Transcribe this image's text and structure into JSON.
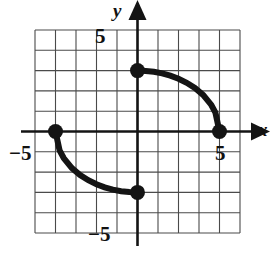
{
  "figure": {
    "kind": "coordinate-grid-graph",
    "background": "#ffffff",
    "ink_color": "#141414",
    "grid_color": "#4a4a4a"
  },
  "axes": {
    "x_axis_label": "x",
    "y_axis_label": "y",
    "x_range": [
      -5,
      5
    ],
    "y_range": [
      -5,
      5
    ],
    "grid": true,
    "grid_step": 1,
    "tick_labels": {
      "y_top": "5",
      "y_bottom": "−5",
      "x_right": "5",
      "x_left": "−5"
    },
    "arrows": {
      "x_positive": true,
      "y_positive": true
    }
  },
  "chart_data": {
    "type": "line",
    "title": "",
    "xlabel": "x",
    "ylabel": "y",
    "xlim": [
      -5,
      5
    ],
    "ylim": [
      -5,
      5
    ],
    "grid": true,
    "legend": "none",
    "series": [
      {
        "name": "arc-quadrant-I",
        "comment": "ellipse arc x^2/16 + y^2/9 = 1, from (0,3) to (4,0)",
        "x": [
          0.0,
          0.4,
          0.8,
          1.2,
          1.6,
          2.0,
          2.4,
          2.8,
          3.2,
          3.6,
          3.8,
          4.0
        ],
        "y": [
          3.0,
          2.985,
          2.94,
          2.863,
          2.751,
          2.598,
          2.4,
          2.142,
          1.8,
          1.308,
          0.936,
          0.0
        ]
      },
      {
        "name": "arc-quadrant-III",
        "comment": "ellipse arc x^2/16 + y^2/9 = 1, from (-4,0) to (0,-3)",
        "x": [
          -4.0,
          -3.8,
          -3.6,
          -3.2,
          -2.8,
          -2.4,
          -2.0,
          -1.6,
          -1.2,
          -0.8,
          -0.4,
          0.0
        ],
        "y": [
          0.0,
          -0.936,
          -1.308,
          -1.8,
          -2.142,
          -2.4,
          -2.598,
          -2.751,
          -2.863,
          -2.94,
          -2.985,
          -3.0
        ]
      }
    ],
    "points": [
      {
        "name": "left-endpoint",
        "x": -4,
        "y": 0,
        "marker": "filled-circle"
      },
      {
        "name": "top-endpoint",
        "x": 0,
        "y": 3,
        "marker": "filled-circle"
      },
      {
        "name": "bottom-endpoint",
        "x": 0,
        "y": -3,
        "marker": "filled-circle"
      },
      {
        "name": "right-endpoint",
        "x": 4,
        "y": 0,
        "marker": "filled-circle"
      }
    ]
  }
}
